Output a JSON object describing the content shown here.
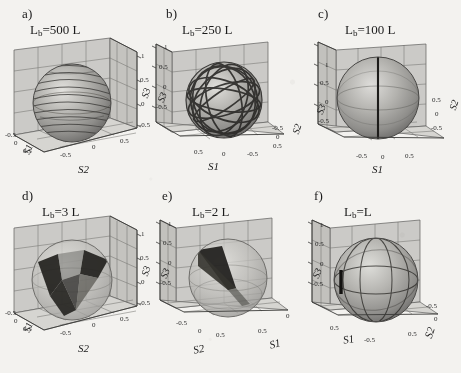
{
  "figure": {
    "caption_present": false,
    "background_hex": "#f3f2ef",
    "ink_hex": "#1b1b1b",
    "sphere_hex": "#9a9a98",
    "grid_hex": "#6b6b6b",
    "floor_hex": "#cfcecb"
  },
  "panels": [
    {
      "letter": "a)",
      "title_prefix": "L",
      "title_sub": "b",
      "title_suffix": "=500 L",
      "beat_length": 500,
      "beat_length_text": "500 L",
      "axes": {
        "vertical": {
          "name": "S3",
          "side": "right",
          "ticks": [
            "1",
            "0.5",
            "0",
            "-0.5"
          ]
        },
        "front": {
          "name": "S2",
          "side": "bottom-right",
          "ticks": [
            "-0.5",
            "0",
            "0.5"
          ]
        },
        "side": {
          "name": "S1",
          "side": "bottom-left",
          "ticks": [
            "-0.5",
            "0",
            "0.5"
          ]
        }
      },
      "trace_style": "dense-spiral-bands",
      "trace_count": 13,
      "description": "Sphere densely wrapped by many near-horizontal spiral bands"
    },
    {
      "letter": "b)",
      "title_prefix": "L",
      "title_sub": "b",
      "title_suffix": "=250 L",
      "beat_length": 250,
      "beat_length_text": "250 L",
      "axes": {
        "vertical": {
          "name": "S3",
          "side": "left",
          "ticks": [
            "1",
            "0.5",
            "0",
            "-0.5"
          ]
        },
        "front": {
          "name": "S1",
          "side": "bottom",
          "ticks": [
            "0.5",
            "0",
            "-0.5"
          ]
        },
        "side": {
          "name": "S2",
          "side": "right",
          "ticks": [
            "-0.5",
            "0",
            "0.5"
          ]
        }
      },
      "trace_style": "bold-great-circles",
      "trace_count": 9,
      "description": "Sphere crossed by bold dark looping great circles at varied tilts"
    },
    {
      "letter": "c)",
      "title_prefix": "L",
      "title_sub": "b",
      "title_suffix": "=100 L",
      "beat_length": 100,
      "beat_length_text": "100 L",
      "axes": {
        "vertical": {
          "name": "S3",
          "side": "left",
          "ticks": [
            "1",
            "0.5",
            "0",
            "-0.5"
          ]
        },
        "front": {
          "name": "S1",
          "side": "bottom",
          "ticks": [
            "-0.5",
            "0",
            "0.5"
          ]
        },
        "side": {
          "name": "S2",
          "side": "right",
          "ticks": [
            "0.5",
            "0",
            "-0.5"
          ]
        }
      },
      "trace_style": "single-meridian",
      "trace_count": 1,
      "description": "Plain shaded sphere with one dark vertical meridian"
    },
    {
      "letter": "d)",
      "title_prefix": "L",
      "title_sub": "b",
      "title_suffix": "=3 L",
      "beat_length": 3,
      "beat_length_text": "3 L",
      "axes": {
        "vertical": {
          "name": "S3",
          "side": "right",
          "ticks": [
            "1",
            "0.5",
            "0",
            "-0.5"
          ]
        },
        "front": {
          "name": "S2",
          "side": "bottom-right",
          "ticks": [
            "-0.5",
            "0",
            "0.5"
          ]
        },
        "side": {
          "name": "S1",
          "side": "bottom-left",
          "ticks": [
            "-0.5",
            "0",
            "0.5"
          ]
        }
      },
      "trace_style": "dark-funnel-lobes",
      "trace_count": 3,
      "description": "Dark butterfly/funnel surface inside translucent sphere converging to lower point"
    },
    {
      "letter": "e)",
      "title_prefix": "L",
      "title_sub": "b",
      "title_suffix": "=2 L",
      "beat_length": 2,
      "beat_length_text": "2 L",
      "axes": {
        "vertical": {
          "name": "S3",
          "side": "left",
          "ticks": [
            "1",
            "0.5",
            "0",
            "-0.5"
          ]
        },
        "front": {
          "name": "S2",
          "side": "bottom-left",
          "ticks": [
            "-0.5",
            "0",
            "0.5"
          ]
        },
        "side": {
          "name": "S1",
          "side": "bottom-right",
          "ticks": [
            "0.5",
            "0"
          ]
        }
      },
      "trace_style": "dark-tapered-wedge",
      "trace_count": 1,
      "description": "Narrow dark wedge tapering from upper left toward sphere centre"
    },
    {
      "letter": "f)",
      "title_prefix": "L",
      "title_sub": "b",
      "title_suffix": "=L",
      "beat_length": 1,
      "beat_length_text": "L",
      "axes": {
        "vertical": {
          "name": "S3",
          "side": "left",
          "ticks": [
            "1",
            "0.5",
            "0",
            "-0.5"
          ]
        },
        "front": {
          "name": "S1",
          "side": "bottom-left",
          "ticks": [
            "0.5",
            "-0.5"
          ]
        },
        "side": {
          "name": "S2",
          "side": "bottom-right",
          "ticks": [
            "-0.5",
            "0",
            "0.5"
          ]
        }
      },
      "trace_style": "short-dark-mark",
      "trace_count": 1,
      "description": "Sphere with outlined meridians and a short thick dark mark at left edge"
    }
  ]
}
